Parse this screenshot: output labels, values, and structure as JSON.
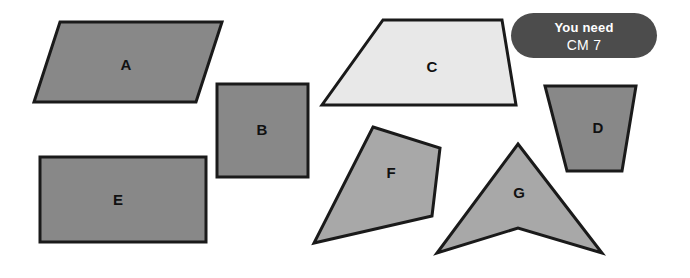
{
  "page": {
    "background": "#ffffff",
    "width": 690,
    "height": 278
  },
  "badge": {
    "name": "you-need-badge",
    "line1": "You need",
    "line2": "CM 7",
    "background_color": "#4c4c4c",
    "text_color": "#ffffff"
  },
  "colors": {
    "outline": "#1a1a1a",
    "fill_medium_gray": "#888888",
    "fill_light_gray": "#a8a8a8",
    "fill_very_light_gray": "#e8e8e8",
    "label_color": "#111111"
  },
  "shapes": [
    {
      "id": "shape-a",
      "label": "A",
      "kind": "parallelogram",
      "fill": "#888888",
      "points": "60,22 222,22 196,102 34,102",
      "label_x": 126,
      "label_y": 64
    },
    {
      "id": "shape-b",
      "label": "B",
      "kind": "square",
      "fill": "#888888",
      "points": "217,84 308,84 308,177 217,177",
      "label_x": 262,
      "label_y": 129
    },
    {
      "id": "shape-c",
      "label": "C",
      "kind": "trapezoid",
      "fill": "#e8e8e8",
      "points": "383,20 502,20 516,105 322,105",
      "label_x": 432,
      "label_y": 66
    },
    {
      "id": "shape-d",
      "label": "D",
      "kind": "parallelogram",
      "fill": "#888888",
      "points": "545,86 636,86 622,171 567,171",
      "label_x": 598,
      "label_y": 127
    },
    {
      "id": "shape-e",
      "label": "E",
      "kind": "rectangle",
      "fill": "#888888",
      "points": "40,157 206,157 206,242 40,242",
      "label_x": 118,
      "label_y": 199
    },
    {
      "id": "shape-f",
      "label": "F",
      "kind": "irregular-quadrilateral",
      "fill": "#a8a8a8",
      "points": "373,127 440,148 432,216 314,243",
      "label_x": 391,
      "label_y": 172
    },
    {
      "id": "shape-g",
      "label": "G",
      "kind": "concave-arrowhead",
      "fill": "#a8a8a8",
      "points": "518,144 602,253 518,228 437,253",
      "label_x": 519,
      "label_y": 192
    }
  ]
}
